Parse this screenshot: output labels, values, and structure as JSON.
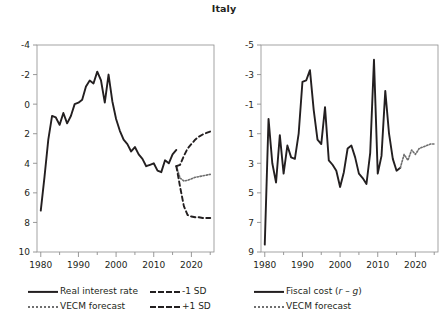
{
  "chart_data": [
    {
      "panel": "left",
      "type": "line",
      "title": "Italy",
      "xlabel": "",
      "ylabel": "",
      "xlim": [
        1979,
        2026
      ],
      "ylim": [
        -4,
        10
      ],
      "yticks": [
        -4,
        -2,
        0,
        2,
        4,
        6,
        8,
        10
      ],
      "xticks": [
        1980,
        1990,
        2000,
        2010,
        2020
      ],
      "xminorticks": [
        1985,
        1995,
        2005,
        2015,
        2025
      ],
      "grid": false,
      "legend_position": "below",
      "series": [
        {
          "name": "Real interest rate",
          "style": "solid",
          "color": "#231f20",
          "x": [
            1980,
            1981,
            1982,
            1983,
            1984,
            1985,
            1986,
            1987,
            1988,
            1989,
            1990,
            1991,
            1992,
            1993,
            1994,
            1995,
            1996,
            1997,
            1998,
            1999,
            2000,
            2001,
            2002,
            2003,
            2004,
            2005,
            2006,
            2007,
            2008,
            2009,
            2010,
            2011,
            2012,
            2013,
            2014,
            2015,
            2016
          ],
          "values": [
            -1.2,
            1.1,
            3.6,
            5.2,
            5.1,
            4.6,
            5.4,
            4.7,
            5.2,
            6.0,
            6.1,
            6.3,
            7.2,
            7.6,
            7.4,
            8.2,
            7.6,
            6.1,
            8.0,
            6.2,
            5.0,
            4.2,
            3.6,
            3.3,
            2.8,
            3.1,
            2.6,
            2.3,
            1.8,
            1.9,
            2.0,
            1.5,
            1.4,
            2.2,
            2.0,
            2.6,
            2.9,
            1.8
          ]
        },
        {
          "name": "VECM forecast",
          "style": "dotted",
          "color": "#6f6f6f",
          "x": [
            2016,
            2017,
            2018,
            2019,
            2020,
            2021,
            2022,
            2023,
            2024,
            2025
          ],
          "values": [
            1.8,
            1.0,
            0.8,
            0.85,
            0.95,
            1.05,
            1.1,
            1.15,
            1.2,
            1.25
          ]
        },
        {
          "name": "-1 SD",
          "style": "dashed",
          "color": "#231f20",
          "x": [
            2016,
            2017,
            2018,
            2019,
            2020,
            2021,
            2022,
            2023,
            2024,
            2025
          ],
          "values": [
            1.8,
            0.4,
            -0.9,
            -1.5,
            -1.6,
            -1.65,
            -1.65,
            -1.7,
            -1.7,
            -1.7
          ]
        },
        {
          "name": "+1 SD",
          "style": "dashed",
          "color": "#231f20",
          "x": [
            2016,
            2017,
            2018,
            2019,
            2020,
            2021,
            2022,
            2023,
            2024,
            2025
          ],
          "values": [
            1.8,
            1.9,
            2.5,
            3.0,
            3.3,
            3.6,
            3.8,
            3.95,
            4.05,
            4.15
          ]
        }
      ],
      "legend": [
        {
          "label": "Real interest rate",
          "style": "solid"
        },
        {
          "label": "-1 SD",
          "style": "dashed"
        },
        {
          "label": "VECM forecast",
          "style": "dotted"
        },
        {
          "label": "+1 SD",
          "style": "dashed"
        }
      ]
    },
    {
      "panel": "right",
      "type": "line",
      "title": "",
      "xlabel": "",
      "ylabel": "",
      "xlim": [
        1979,
        2026
      ],
      "ylim": [
        -5,
        9
      ],
      "yticks": [
        -5,
        -3,
        -1,
        1,
        3,
        5,
        7,
        9
      ],
      "xticks": [
        1980,
        1990,
        2000,
        2010,
        2020
      ],
      "xminorticks": [
        1985,
        1995,
        2005,
        2015,
        2025
      ],
      "grid": false,
      "legend_position": "below",
      "series": [
        {
          "name": "Fiscal cost (r - g)",
          "style": "solid",
          "color": "#231f20",
          "x": [
            1980,
            1981,
            1982,
            1983,
            1984,
            1985,
            1986,
            1987,
            1988,
            1989,
            1990,
            1991,
            1992,
            1993,
            1994,
            1995,
            1996,
            1997,
            1998,
            1999,
            2000,
            2001,
            2002,
            2003,
            2004,
            2005,
            2006,
            2007,
            2008,
            2009,
            2010,
            2011,
            2012,
            2013,
            2014,
            2015,
            2016
          ],
          "values": [
            -4.5,
            4.0,
            1.0,
            -0.3,
            2.9,
            0.3,
            2.2,
            1.4,
            1.3,
            3.0,
            6.5,
            6.6,
            7.3,
            4.6,
            2.6,
            2.3,
            4.8,
            1.2,
            0.9,
            0.5,
            -0.6,
            0.4,
            2.0,
            2.2,
            1.4,
            0.3,
            0.0,
            -0.4,
            1.7,
            8.0,
            0.3,
            1.5,
            5.9,
            3.0,
            1.3,
            0.5,
            0.7
          ]
        },
        {
          "name": "VECM forecast",
          "style": "dotted",
          "color": "#6f6f6f",
          "x": [
            2016,
            2017,
            2018,
            2019,
            2020,
            2021,
            2022,
            2023,
            2024,
            2025
          ],
          "values": [
            0.7,
            1.6,
            1.2,
            1.9,
            1.6,
            2.0,
            2.1,
            2.2,
            2.3,
            2.3
          ]
        }
      ],
      "legend": [
        {
          "label": "Fiscal cost (r – g)",
          "style": "solid",
          "italic_parts": [
            "r",
            "g"
          ]
        },
        {
          "label": "VECM forecast",
          "style": "dotted"
        }
      ]
    }
  ],
  "title": "Italy",
  "panels": {
    "left": {
      "yticklabels": [
        "10",
        "8",
        "6",
        "4",
        "2",
        "0",
        "-2",
        "-4"
      ],
      "xticklabels": [
        "1980",
        "1990",
        "2000",
        "2010",
        "2020"
      ],
      "legend": {
        "row1_left": "Real interest rate",
        "row1_right": "-1 SD",
        "row2_left": "VECM forecast",
        "row2_right": "+1 SD"
      }
    },
    "right": {
      "yticklabels": [
        "9",
        "7",
        "5",
        "3",
        "1",
        "-1",
        "-3",
        "-5"
      ],
      "xticklabels": [
        "1980",
        "1990",
        "2000",
        "2010",
        "2020"
      ],
      "legend": {
        "row1": "Fiscal cost (",
        "row1_r": "r",
        "row1_mid": " – ",
        "row1_g": "g",
        "row1_end": ")",
        "row2": "VECM forecast"
      }
    }
  },
  "colors": {
    "line": "#231f20",
    "forecast": "#6f6f6f",
    "axis": "#8d8d8d",
    "background": "#ffffff"
  }
}
